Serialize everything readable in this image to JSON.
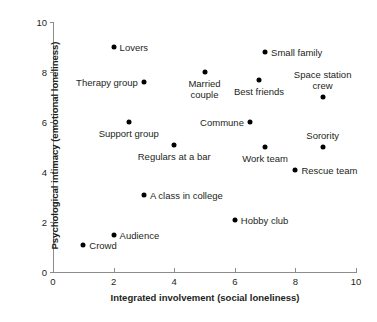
{
  "chart_data": {
    "type": "scatter",
    "title": "",
    "xlabel": "Integrated involvement (social loneliness)",
    "ylabel": "Psychological intimacy (emotional loneliness)",
    "xlim": [
      0,
      10
    ],
    "ylim": [
      0,
      10
    ],
    "xticks": [
      "0",
      "2",
      "4",
      "6",
      "8",
      "10"
    ],
    "yticks": [
      "0",
      "2",
      "4",
      "6",
      "8",
      "10"
    ],
    "xtick_values": [
      0,
      2,
      4,
      6,
      8,
      10
    ],
    "ytick_values": [
      0,
      2,
      4,
      6,
      8,
      10
    ],
    "grid": false,
    "legend": false,
    "marker_color": "#000000",
    "axis_color": "#8c8c8c",
    "points": [
      {
        "label": "Lovers",
        "x": 2.0,
        "y": 9.0,
        "label_pos": "right"
      },
      {
        "label": "Small family",
        "x": 7.0,
        "y": 8.8,
        "label_pos": "right"
      },
      {
        "label": "Married\ncouple",
        "x": 5.0,
        "y": 8.0,
        "label_pos": "below"
      },
      {
        "label": "Therapy group",
        "x": 3.0,
        "y": 7.6,
        "label_pos": "left"
      },
      {
        "label": "Best friends",
        "x": 6.8,
        "y": 7.7,
        "label_pos": "below"
      },
      {
        "label": "Space station\ncrew",
        "x": 8.9,
        "y": 7.0,
        "label_pos": "above"
      },
      {
        "label": "Support group",
        "x": 2.5,
        "y": 6.0,
        "label_pos": "below"
      },
      {
        "label": "Commune",
        "x": 6.5,
        "y": 6.0,
        "label_pos": "left"
      },
      {
        "label": "Sorority",
        "x": 8.9,
        "y": 5.0,
        "label_pos": "above"
      },
      {
        "label": "Regulars at a bar",
        "x": 4.0,
        "y": 5.1,
        "label_pos": "below"
      },
      {
        "label": "Work team",
        "x": 7.0,
        "y": 5.0,
        "label_pos": "below"
      },
      {
        "label": "Rescue team",
        "x": 8.0,
        "y": 4.1,
        "label_pos": "right"
      },
      {
        "label": "A class in college",
        "x": 3.0,
        "y": 3.1,
        "label_pos": "right"
      },
      {
        "label": "Hobby club",
        "x": 6.0,
        "y": 2.1,
        "label_pos": "right"
      },
      {
        "label": "Audience",
        "x": 2.0,
        "y": 1.5,
        "label_pos": "right"
      },
      {
        "label": "Crowd",
        "x": 1.0,
        "y": 1.1,
        "label_pos": "right"
      }
    ]
  },
  "caption": {
    "partial_text": ""
  }
}
